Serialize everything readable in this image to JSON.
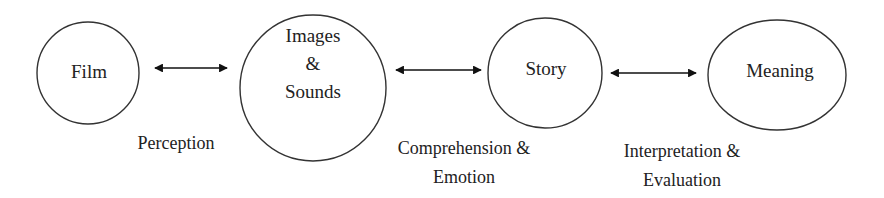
{
  "diagram": {
    "type": "flow",
    "stroke_color": "#333333",
    "arrow_color": "#111111",
    "nodes": [
      {
        "id": "film",
        "label": "Film",
        "lines": [
          "Film"
        ],
        "shape": "circle"
      },
      {
        "id": "images-sounds",
        "label": "Images & Sounds",
        "lines": [
          "Images",
          "&",
          "Sounds"
        ],
        "shape": "circle"
      },
      {
        "id": "story",
        "label": "Story",
        "lines": [
          "Story"
        ],
        "shape": "circle"
      },
      {
        "id": "meaning",
        "label": "Meaning",
        "lines": [
          "Meaning"
        ],
        "shape": "ellipse"
      }
    ],
    "edges": [
      {
        "from": "film",
        "to": "images-sounds",
        "direction": "bidirectional",
        "label": "Perception",
        "lines": [
          "Perception"
        ]
      },
      {
        "from": "images-sounds",
        "to": "story",
        "direction": "bidirectional",
        "label": "Comprehension & Emotion",
        "lines": [
          "Comprehension &",
          "Emotion"
        ]
      },
      {
        "from": "story",
        "to": "meaning",
        "direction": "bidirectional",
        "label": "Interpretation & Evaluation",
        "lines": [
          "Interpretation &",
          "Evaluation"
        ]
      }
    ]
  }
}
